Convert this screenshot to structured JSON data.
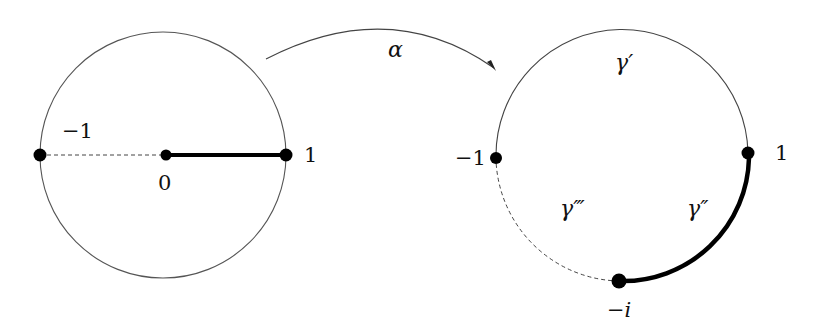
{
  "diagram": {
    "mapping_label": "α",
    "left_disk": {
      "labels": {
        "minus_one": "−1",
        "zero": "0",
        "one": "1"
      }
    },
    "right_circle": {
      "labels": {
        "minus_one": "−1",
        "one": "1",
        "minus_i": "−i",
        "gamma_prime": "γ′",
        "gamma_double_prime": "γ″",
        "gamma_triple_prime": "γ‴"
      }
    }
  }
}
